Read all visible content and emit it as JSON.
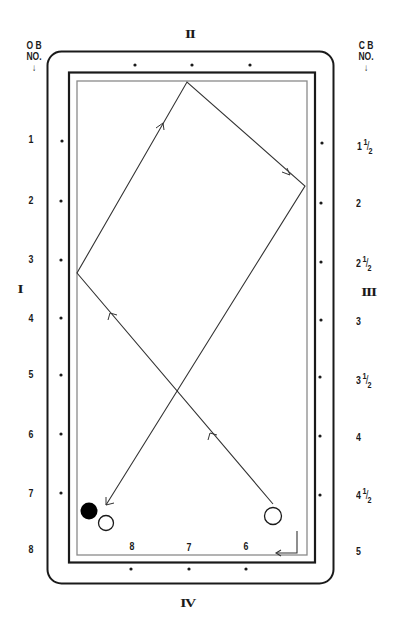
{
  "headers": {
    "left": {
      "line1": "O B",
      "line2": "NO.",
      "arrow": "↓"
    },
    "right": {
      "line1": "C B",
      "line2": "NO.",
      "arrow": "↓"
    }
  },
  "rails": {
    "left": "I",
    "top": "II",
    "right": "III",
    "bottom": "IV"
  },
  "left_numbers": [
    "1",
    "2",
    "3",
    "4",
    "5",
    "6",
    "7",
    "8"
  ],
  "right_numbers": [
    {
      "whole": "1",
      "num": "1",
      "den": "2"
    },
    {
      "whole": "2",
      "num": "",
      "den": ""
    },
    {
      "whole": "2",
      "num": "1",
      "den": "2"
    },
    {
      "whole": "3",
      "num": "",
      "den": ""
    },
    {
      "whole": "3",
      "num": "1",
      "den": "2"
    },
    {
      "whole": "4",
      "num": "",
      "den": ""
    },
    {
      "whole": "4",
      "num": "1",
      "den": "2"
    },
    {
      "whole": "5",
      "num": "",
      "den": ""
    }
  ],
  "bottom_numbers": [
    "8",
    "7",
    "6"
  ],
  "balls": {
    "object_ball": {
      "color": "#000000",
      "fill": "black"
    },
    "white_ball": {
      "color": "#ffffff",
      "fill": "white"
    },
    "cue_ball": {
      "color": "#ffffff",
      "fill": "white"
    }
  },
  "path_points": [
    [
      273,
      504
    ],
    [
      77,
      273
    ],
    [
      187,
      82
    ],
    [
      305,
      186
    ],
    [
      106,
      505
    ]
  ],
  "colors": {
    "frame": "#1a1a1a",
    "cushion": "#8a8a8a",
    "path": "#333333",
    "background": "#ffffff"
  }
}
